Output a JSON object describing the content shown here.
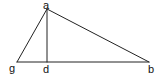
{
  "diagram": {
    "type": "triangle-with-altitude",
    "colors": {
      "stroke": "#222222",
      "label": "#111111",
      "background": "#ffffff"
    },
    "points": {
      "a": {
        "label": "a",
        "x": 47,
        "y": 9
      },
      "g": {
        "label": "g",
        "x": 17,
        "y": 62
      },
      "d": {
        "label": "d",
        "x": 47,
        "y": 62
      },
      "b": {
        "label": "b",
        "x": 149,
        "y": 62
      }
    },
    "segments": [
      {
        "from": "a",
        "to": "g"
      },
      {
        "from": "a",
        "to": "b"
      },
      {
        "from": "g",
        "to": "b"
      },
      {
        "from": "a",
        "to": "d"
      }
    ],
    "labels": {
      "a": "a",
      "g": "g",
      "d": "d",
      "b": "b"
    }
  }
}
